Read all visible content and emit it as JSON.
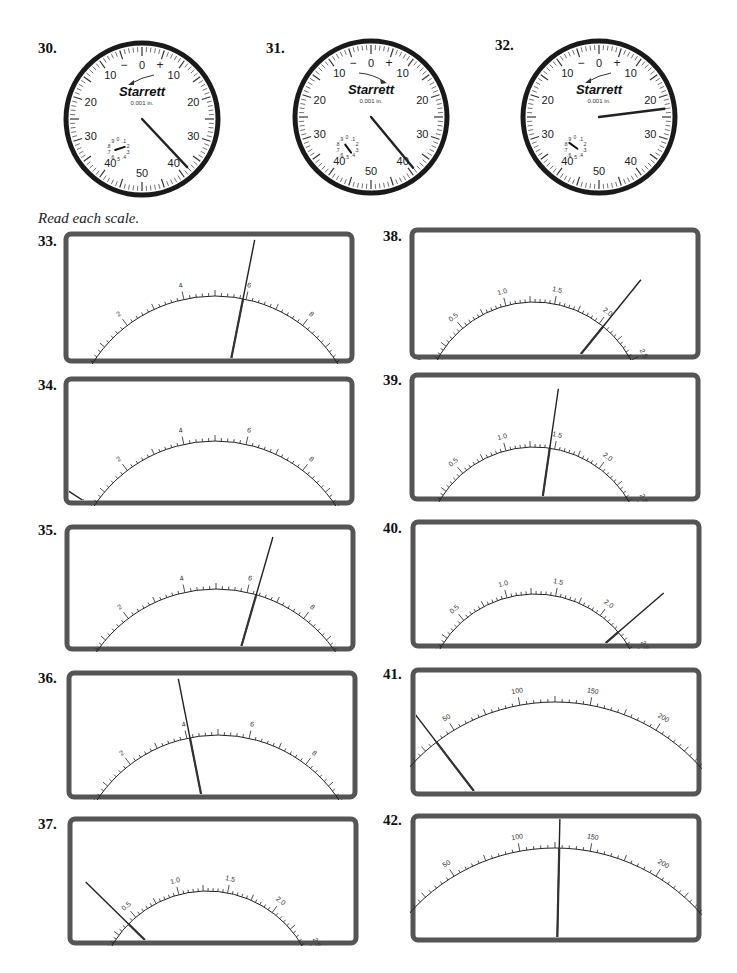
{
  "header": {
    "instruction": "Read each scale."
  },
  "dials": [
    {
      "number": "30.",
      "brand": "Starrett",
      "unit": "0.001 in.",
      "outer_labels": [
        "0",
        "10",
        "20",
        "30",
        "40",
        "50",
        "40",
        "30",
        "20",
        "10"
      ],
      "sign_minus": "−",
      "sign_plus": "+",
      "arrow_direction": "counterclockwise",
      "pointer_value": 38,
      "revolution_value": 0.2
    },
    {
      "number": "31.",
      "brand": "Starrett",
      "unit": "0.001 in.",
      "outer_labels": [
        "0",
        "10",
        "20",
        "30",
        "40",
        "50",
        "40",
        "30",
        "20",
        "10"
      ],
      "sign_minus": "−",
      "sign_plus": "+",
      "arrow_direction": "clockwise",
      "pointer_value": 39,
      "revolution_value": 0.4
    },
    {
      "number": "32.",
      "brand": "Starrett",
      "unit": "0.001 in.",
      "outer_labels": [
        "0",
        "10",
        "20",
        "30",
        "40",
        "50",
        "40",
        "30",
        "20",
        "10"
      ],
      "sign_minus": "−",
      "sign_plus": "+",
      "arrow_direction": "counterclockwise",
      "pointer_value": 23,
      "revolution_value": 0.85
    }
  ],
  "dial_small_labels": [
    "0",
    ".1",
    ".2",
    ".3",
    ".4",
    ".5",
    ".6",
    ".7",
    ".8",
    ".9"
  ],
  "meters": [
    {
      "number": "33.",
      "scale": "ac10",
      "needle_value": 5.9
    },
    {
      "number": "34.",
      "scale": "ac10",
      "needle_value": 0.4
    },
    {
      "number": "35.",
      "scale": "ac10",
      "needle_value": 6.3
    },
    {
      "number": "36.",
      "scale": "ac10",
      "needle_value": 4.1
    },
    {
      "number": "37.",
      "scale": "vac25",
      "needle_value": 0.4
    },
    {
      "number": "38.",
      "scale": "vac25",
      "needle_value": 2.05
    },
    {
      "number": "39.",
      "scale": "vac25",
      "needle_value": 1.45
    },
    {
      "number": "40.",
      "scale": "vac25",
      "needle_value": 2.25
    },
    {
      "number": "41.",
      "scale": "dc250",
      "needle_value": 35
    },
    {
      "number": "42.",
      "scale": "dc250",
      "needle_value": 128
    }
  ],
  "scales": {
    "ac10": {
      "min": 0,
      "max": 10,
      "major": [
        "0",
        "2",
        "4",
        "6",
        "8",
        "10"
      ],
      "major_step": 2,
      "minor_step": 0.2,
      "mid_step": 1,
      "end_label_left": "ac",
      "end_label_right": "ac"
    },
    "vac25": {
      "min": 0,
      "max": 2.5,
      "major": [
        "0",
        "0.5",
        "1.0",
        "1.5",
        "2.0",
        "2.5"
      ],
      "major_step": 0.5,
      "minor_step": 0.05,
      "mid_step": 0.25,
      "end_label_left": "2.5 Vac only"
    },
    "dc250": {
      "min": 0,
      "max": 250,
      "major": [
        "0",
        "50",
        "100",
        "150",
        "200",
        "250"
      ],
      "major_step": 50,
      "minor_step": 5,
      "mid_step": 25,
      "end_label_left": "dc",
      "end_label_right": "dc"
    }
  }
}
